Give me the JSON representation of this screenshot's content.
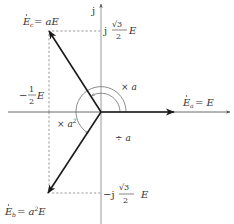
{
  "diagram": {
    "type": "phasor-diagram",
    "axes": {
      "imag_label": "j",
      "origin": [
        101,
        112
      ]
    },
    "phasors": [
      {
        "id": "Ea",
        "label_main": "E",
        "label_sub": "a",
        "label_rhs": "= E",
        "tip": [
          174,
          112
        ]
      },
      {
        "id": "Ec",
        "label_main": "E",
        "label_sub": "c",
        "label_rhs": "= aE",
        "tip": [
          49,
          31
        ]
      },
      {
        "id": "Eb",
        "label_main": "E",
        "label_sub": "b",
        "label_rhs": "= a",
        "label_rhs_sup": "2",
        "label_rhs_tail": "E",
        "tip": [
          48,
          193
        ]
      }
    ],
    "ticks": {
      "top_imag": {
        "prefix": "j",
        "num": "√3",
        "den": "2",
        "suffix": "E"
      },
      "bottom_imag": {
        "prefix": "−j",
        "num": "√3",
        "den": "2",
        "suffix": "E"
      },
      "left_real": {
        "prefix": "−",
        "num": "1",
        "den": "2",
        "suffix": "E"
      }
    },
    "operators": {
      "mult_a": "× a",
      "div_a": "÷ a",
      "mult_a2_base": "× a",
      "mult_a2_sup": "2"
    },
    "colors": {
      "phasor": "#1a1a1a",
      "axis": "#8c8c8c",
      "dashed": "#8c8c8c",
      "arc": "#6e6e6e",
      "text": "#333333"
    }
  }
}
